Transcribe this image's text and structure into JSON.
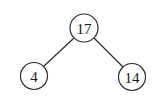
{
  "tree": {
    "root": {
      "label": "17"
    },
    "left": {
      "label": "4"
    },
    "right": {
      "label": "14"
    }
  },
  "colors": {
    "stroke": "#2a2a2a",
    "text": "#1a1a1a",
    "background": "#ffffff"
  }
}
